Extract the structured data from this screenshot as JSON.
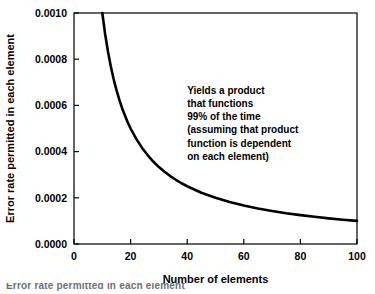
{
  "chart_data": {
    "type": "line",
    "title": "",
    "subtitle": "",
    "xlabel": "Number of elements",
    "ylabel": "Error rate permitted in each element",
    "xlim": [
      0,
      100
    ],
    "ylim": [
      0.0,
      0.001
    ],
    "xticks": [
      0,
      20,
      40,
      60,
      80,
      100
    ],
    "xtick_labels": [
      "0",
      "20",
      "40",
      "60",
      "80",
      "100"
    ],
    "yticks": [
      0.0,
      0.0002,
      0.0004,
      0.0006,
      0.0008,
      0.001
    ],
    "ytick_labels": [
      "0.0000",
      "0.0002",
      "0.0004",
      "0.0006",
      "0.0008",
      "0.0010"
    ],
    "grid": false,
    "legend": null,
    "legend_position": "none",
    "series": [
      {
        "name": "Error rate permitted per element",
        "equation": "y = 0.01 / x",
        "color": "#000000",
        "line_width": 2.6,
        "x": [
          10,
          11,
          12,
          13,
          14,
          15,
          16,
          17,
          18,
          19,
          20,
          22,
          24,
          26,
          28,
          30,
          32,
          34,
          36,
          38,
          40,
          45,
          50,
          55,
          60,
          65,
          70,
          75,
          80,
          85,
          90,
          95,
          100
        ],
        "values": [
          0.001,
          0.000909,
          0.000833,
          0.000769,
          0.000714,
          0.000667,
          0.000625,
          0.000588,
          0.000556,
          0.000526,
          0.0005,
          0.000455,
          0.000417,
          0.000385,
          0.000357,
          0.000333,
          0.000313,
          0.000294,
          0.000278,
          0.000263,
          0.00025,
          0.000222,
          0.0002,
          0.000182,
          0.000167,
          0.000154,
          0.000143,
          0.000133,
          0.000125,
          0.000118,
          0.000111,
          0.000105,
          0.0001
        ]
      }
    ],
    "annotations": [
      {
        "name": "yields-note",
        "x": 40,
        "y": 0.00065,
        "lines": [
          "Yields a product",
          "that functions",
          "99% of the time",
          "(assuming that product",
          "function is dependent",
          "on each element)"
        ]
      }
    ]
  },
  "figure": {
    "background": "#ffffff",
    "frame_color": "#000000",
    "caption_fragment": "Error rate permitted in each element"
  }
}
